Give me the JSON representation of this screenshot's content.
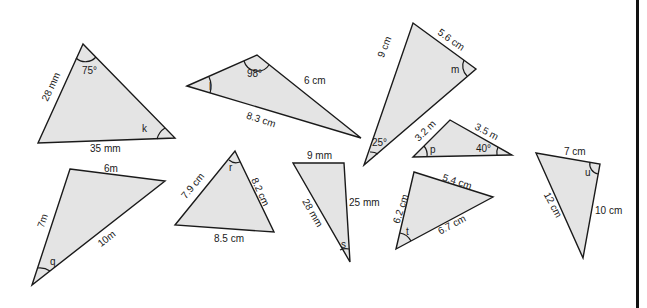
{
  "worksheet": {
    "triangles": [
      {
        "id": "k",
        "sides": [
          "28 mm",
          "35 mm"
        ],
        "angles": [
          "75°",
          "k"
        ]
      },
      {
        "id": "l",
        "sides": [
          "6 cm",
          "8.3 cm"
        ],
        "angles": [
          "98°",
          "l"
        ]
      },
      {
        "id": "m",
        "sides": [
          "9 cm",
          "5.6 cm"
        ],
        "angles": [
          "25°",
          "m"
        ]
      },
      {
        "id": "p",
        "sides": [
          "3.2 m",
          "3.5 m"
        ],
        "angles": [
          "40°",
          "p"
        ]
      },
      {
        "id": "q",
        "sides": [
          "6m",
          "7m",
          "10m"
        ],
        "angles": [
          "q"
        ]
      },
      {
        "id": "r",
        "sides": [
          "7.9 cm",
          "8.2 cm",
          "8.5 cm"
        ],
        "angles": [
          "r"
        ]
      },
      {
        "id": "s",
        "sides": [
          "9 mm",
          "25 mm",
          "28 mm"
        ],
        "angles": [
          "s"
        ]
      },
      {
        "id": "t",
        "sides": [
          "6.2 cm",
          "5.4 cm",
          "6.7 cm"
        ],
        "angles": [
          "t"
        ]
      },
      {
        "id": "u",
        "sides": [
          "7 cm",
          "12 cm",
          "10 cm"
        ],
        "angles": [
          "u"
        ]
      }
    ]
  }
}
